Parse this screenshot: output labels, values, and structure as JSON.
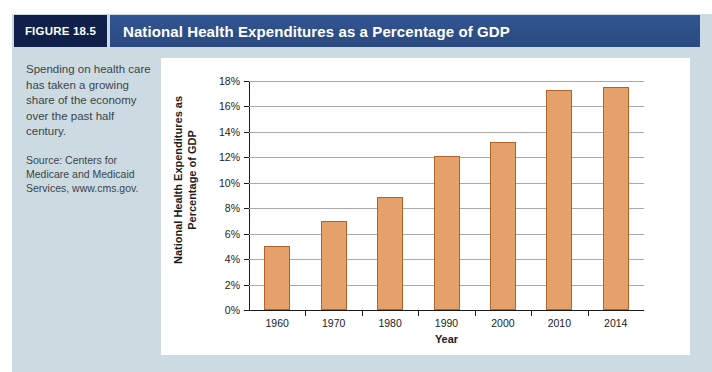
{
  "figure": {
    "badge_label": "FIGURE 18.5",
    "title": "National Health Expenditures as a Percentage of GDP",
    "badge_color": "#10204a",
    "title_bar_color": "#2f5493",
    "page_tint_color": "#ccdbe2"
  },
  "caption": {
    "lead": "Spending on health care has taken a growing share of the economy over the past half century.",
    "source": "Source: Centers for Medicare and Medicaid Services, www.cms.gov."
  },
  "chart_data": {
    "type": "bar",
    "title": "National Health Expenditures as a Percentage of GDP",
    "categories": [
      "1960",
      "1970",
      "1980",
      "1990",
      "2000",
      "2010",
      "2014"
    ],
    "values": [
      5.0,
      7.0,
      8.9,
      12.1,
      13.2,
      17.3,
      17.5
    ],
    "xlabel": "Year",
    "ylabel": "National Health Expenditures as Percentage of GDP",
    "ylabel_lines": [
      "National Health Expenditures as",
      "Percentage of GDP"
    ],
    "ylim": [
      0,
      18
    ],
    "ytick_step": 2,
    "ytick_labels": [
      "0%",
      "2%",
      "4%",
      "6%",
      "8%",
      "10%",
      "12%",
      "14%",
      "16%",
      "18%"
    ],
    "grid": true,
    "legend": false,
    "bar_color": "#e4a16b",
    "bar_border_color": "#b3632a",
    "gridline_color": "#a9a9a9",
    "axis_color": "#1b1b1b"
  }
}
